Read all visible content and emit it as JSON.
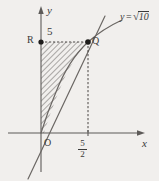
{
  "figure": {
    "kind": "cartesian-plot",
    "background_color": "#f1efed",
    "ink_color": "#3a3a3a",
    "axes": {
      "x_axis_label": "x",
      "y_axis_label": "y",
      "origin_label": "O"
    },
    "labels": {
      "point_R": "R",
      "point_Q": "Q",
      "y_tick_value": "5",
      "x_tick_numerator": "5",
      "x_tick_denominator": "2"
    },
    "curve_label": {
      "lhs": "y",
      "equals": "=",
      "radical": "√",
      "radicand": "10"
    },
    "geometry": {
      "points": [
        {
          "name": "R",
          "x": 0,
          "y": 5
        },
        {
          "name": "Q",
          "x": 2.5,
          "y": 5
        },
        {
          "name": "O",
          "x": 0,
          "y": 0
        }
      ],
      "curve": "y = sqrt(10x)",
      "secant_line_through_origin_and_Q": true,
      "shaded_region": "between curve y=sqrt(10x), line y=5 and the y-axis",
      "shading_style": "diagonal-hatch",
      "dashed_segments": [
        "R to Q",
        "Q to x-axis at 5/2"
      ]
    }
  }
}
